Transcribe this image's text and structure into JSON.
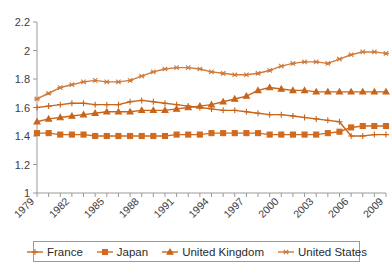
{
  "chart_data": {
    "type": "line",
    "title": "",
    "subtitle": "",
    "xlabel": "",
    "ylabel": "",
    "xlim": [
      1979,
      2009
    ],
    "ylim": [
      1.0,
      2.2
    ],
    "ytick_values": [
      1.0,
      1.2,
      1.4,
      1.6,
      1.8,
      2.0,
      2.2
    ],
    "ytick_labels": [
      "1",
      "1.2",
      "1.4",
      "1.6",
      "1.8",
      "2",
      "2.2"
    ],
    "x": [
      1979,
      1980,
      1981,
      1982,
      1983,
      1984,
      1985,
      1986,
      1987,
      1988,
      1989,
      1990,
      1991,
      1992,
      1993,
      1994,
      1995,
      1996,
      1997,
      1998,
      1999,
      2000,
      2001,
      2002,
      2003,
      2004,
      2005,
      2006,
      2007,
      2008,
      2009
    ],
    "xtick_values": [
      1979,
      1980,
      1981,
      1982,
      1983,
      1984,
      1985,
      1986,
      1987,
      1988,
      1989,
      1990,
      1991,
      1992,
      1993,
      1994,
      1995,
      1996,
      1997,
      1998,
      1999,
      2000,
      2001,
      2002,
      2003,
      2004,
      2005,
      2006,
      2007,
      2008,
      2009
    ],
    "xtick_labels_shown": [
      "1979",
      "1982",
      "1985",
      "1988",
      "1991",
      "1994",
      "1997",
      "2000",
      "2003",
      "2006",
      "2009"
    ],
    "xtick_label_interval": 3,
    "grid": false,
    "legend_position": "bottom",
    "series": [
      {
        "name": "France",
        "marker": "plus",
        "color": "#C8651B",
        "values": [
          1.6,
          1.61,
          1.62,
          1.63,
          1.63,
          1.62,
          1.62,
          1.62,
          1.64,
          1.65,
          1.64,
          1.63,
          1.62,
          1.61,
          1.6,
          1.59,
          1.58,
          1.58,
          1.57,
          1.56,
          1.55,
          1.55,
          1.54,
          1.53,
          1.52,
          1.51,
          1.5,
          1.4,
          1.4,
          1.41,
          1.41
        ]
      },
      {
        "name": "Japan",
        "marker": "square",
        "color": "#D06A1E",
        "values": [
          1.42,
          1.42,
          1.41,
          1.41,
          1.41,
          1.4,
          1.4,
          1.4,
          1.4,
          1.4,
          1.4,
          1.4,
          1.41,
          1.41,
          1.41,
          1.42,
          1.42,
          1.42,
          1.42,
          1.42,
          1.41,
          1.41,
          1.41,
          1.41,
          1.41,
          1.42,
          1.43,
          1.46,
          1.47,
          1.47,
          1.47
        ]
      },
      {
        "name": "United Kingdom",
        "marker": "triangle",
        "color": "#C8651B",
        "values": [
          1.5,
          1.52,
          1.53,
          1.54,
          1.55,
          1.56,
          1.57,
          1.57,
          1.57,
          1.58,
          1.58,
          1.58,
          1.59,
          1.6,
          1.61,
          1.62,
          1.64,
          1.66,
          1.68,
          1.72,
          1.74,
          1.73,
          1.72,
          1.72,
          1.71,
          1.71,
          1.71,
          1.71,
          1.71,
          1.71,
          1.71
        ]
      },
      {
        "name": "United States",
        "marker": "asterisk",
        "color": "#CF7B3B",
        "values": [
          1.66,
          1.7,
          1.74,
          1.76,
          1.78,
          1.79,
          1.78,
          1.78,
          1.79,
          1.82,
          1.85,
          1.87,
          1.88,
          1.88,
          1.87,
          1.85,
          1.84,
          1.83,
          1.83,
          1.84,
          1.86,
          1.89,
          1.91,
          1.92,
          1.92,
          1.91,
          1.94,
          1.97,
          1.99,
          1.99,
          1.98
        ]
      }
    ],
    "legend": [
      {
        "label": "France",
        "marker": "plus"
      },
      {
        "label": "Japan",
        "marker": "square"
      },
      {
        "label": "United Kingdom",
        "marker": "triangle"
      },
      {
        "label": "United States",
        "marker": "asterisk"
      }
    ],
    "colors": {
      "line": "#C8651B",
      "axis": "#9a9a9a",
      "text": "#2b2b2b",
      "background": "#ffffff"
    }
  }
}
